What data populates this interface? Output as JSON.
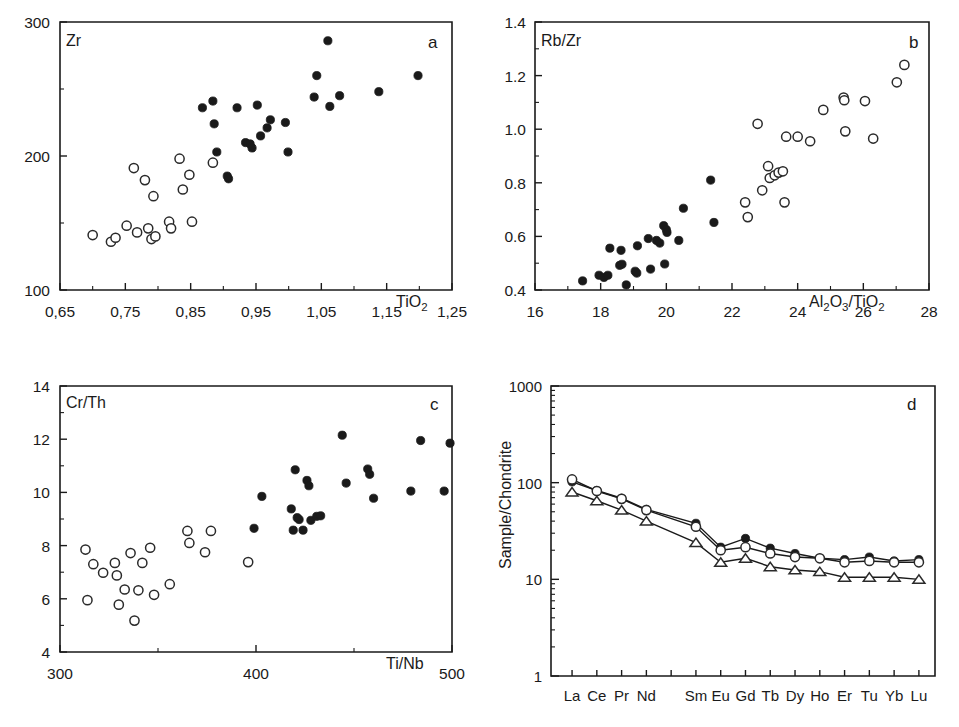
{
  "figure": {
    "panels": [
      "a",
      "b",
      "c",
      "d"
    ]
  },
  "chart_data": [
    {
      "type": "scatter",
      "panel_letter": "a",
      "title": "",
      "ylabel": "Zr",
      "xlabel": "TiO2",
      "xlabel_parts": {
        "base1": "TiO",
        "sub1": "2"
      },
      "xlim": [
        0.65,
        1.25
      ],
      "ylim": [
        100,
        300
      ],
      "xticks": [
        0.65,
        0.75,
        0.85,
        0.95,
        1.05,
        1.15,
        1.25
      ],
      "xticklabels": [
        "0,65",
        "0,75",
        "0,85",
        "0,95",
        "1,05",
        "1,15",
        "1,25"
      ],
      "yticks": [
        100,
        200,
        300
      ],
      "yticklabels": [
        "100",
        "200",
        "300"
      ],
      "yticks_minor": [
        150,
        250
      ],
      "grid": false,
      "legend": "none",
      "series": [
        {
          "name": "open-circle-group",
          "marker": "open-circle",
          "points": [
            [
              0.7,
              141
            ],
            [
              0.728,
              136
            ],
            [
              0.735,
              139
            ],
            [
              0.752,
              148
            ],
            [
              0.763,
              191
            ],
            [
              0.768,
              143
            ],
            [
              0.78,
              182
            ],
            [
              0.785,
              146
            ],
            [
              0.79,
              138
            ],
            [
              0.796,
              140
            ],
            [
              0.793,
              170
            ],
            [
              0.817,
              151
            ],
            [
              0.82,
              146
            ],
            [
              0.833,
              198
            ],
            [
              0.838,
              175
            ],
            [
              0.848,
              186
            ],
            [
              0.852,
              151
            ],
            [
              0.884,
              195
            ]
          ]
        },
        {
          "name": "filled-circle-group",
          "marker": "filled-circle",
          "points": [
            [
              0.868,
              236
            ],
            [
              0.884,
              241
            ],
            [
              0.886,
              224
            ],
            [
              0.89,
              203
            ],
            [
              0.906,
              185
            ],
            [
              0.908,
              183
            ],
            [
              0.921,
              236
            ],
            [
              0.934,
              210
            ],
            [
              0.941,
              209
            ],
            [
              0.944,
              206
            ],
            [
              0.952,
              238
            ],
            [
              0.957,
              215
            ],
            [
              0.967,
              221
            ],
            [
              0.972,
              227
            ],
            [
              0.995,
              225
            ],
            [
              0.999,
              203
            ],
            [
              1.039,
              244
            ],
            [
              1.043,
              260
            ],
            [
              1.06,
              286
            ],
            [
              1.063,
              237
            ],
            [
              1.078,
              245
            ],
            [
              1.138,
              248
            ],
            [
              1.198,
              260
            ]
          ]
        }
      ]
    },
    {
      "type": "scatter",
      "panel_letter": "b",
      "title": "",
      "ylabel": "Rb/Zr",
      "xlabel": "Al2O3/TiO2",
      "xlabel_parts": {
        "base1": "Al",
        "sub1": "2",
        "base2": "O",
        "sub2": "3",
        "base3": "/TiO",
        "sub3": "2"
      },
      "xlim": [
        16,
        28
      ],
      "ylim": [
        0.4,
        1.4
      ],
      "xticks": [
        16,
        18,
        20,
        22,
        24,
        26,
        28
      ],
      "xticklabels": [
        "16",
        "18",
        "20",
        "22",
        "24",
        "26",
        "28"
      ],
      "yticks": [
        0.4,
        0.6,
        0.8,
        1.0,
        1.2,
        1.4
      ],
      "yticklabels": [
        "0.4",
        "0.6",
        "0.8",
        "1.0",
        "1.2",
        "1.4"
      ],
      "grid": false,
      "legend": "none",
      "series": [
        {
          "name": "filled-circle-group",
          "marker": "filled-circle",
          "points": [
            [
              17.45,
              0.434
            ],
            [
              17.95,
              0.455
            ],
            [
              18.1,
              0.447
            ],
            [
              18.22,
              0.455
            ],
            [
              18.28,
              0.556
            ],
            [
              18.58,
              0.492
            ],
            [
              18.62,
              0.548
            ],
            [
              18.65,
              0.496
            ],
            [
              18.78,
              0.419
            ],
            [
              19.05,
              0.47
            ],
            [
              19.1,
              0.463
            ],
            [
              19.12,
              0.565
            ],
            [
              19.45,
              0.592
            ],
            [
              19.52,
              0.478
            ],
            [
              19.7,
              0.585
            ],
            [
              19.8,
              0.575
            ],
            [
              19.92,
              0.64
            ],
            [
              19.95,
              0.497
            ],
            [
              20.0,
              0.625
            ],
            [
              20.02,
              0.615
            ],
            [
              20.38,
              0.585
            ],
            [
              20.52,
              0.705
            ],
            [
              21.35,
              0.81
            ],
            [
              21.45,
              0.652
            ]
          ]
        },
        {
          "name": "open-circle-group",
          "marker": "open-circle",
          "points": [
            [
              22.4,
              0.727
            ],
            [
              22.48,
              0.672
            ],
            [
              22.78,
              1.02
            ],
            [
              22.92,
              0.772
            ],
            [
              23.1,
              0.862
            ],
            [
              23.15,
              0.818
            ],
            [
              23.3,
              0.828
            ],
            [
              23.42,
              0.838
            ],
            [
              23.55,
              0.843
            ],
            [
              23.6,
              0.727
            ],
            [
              23.65,
              0.972
            ],
            [
              24.0,
              0.972
            ],
            [
              24.38,
              0.955
            ],
            [
              24.78,
              1.072
            ],
            [
              25.4,
              1.118
            ],
            [
              25.42,
              1.108
            ],
            [
              25.45,
              0.992
            ],
            [
              26.05,
              1.105
            ],
            [
              26.3,
              0.965
            ],
            [
              27.02,
              1.175
            ],
            [
              27.25,
              1.24
            ]
          ]
        }
      ]
    },
    {
      "type": "scatter",
      "panel_letter": "c",
      "title": "",
      "ylabel": "Cr/Th",
      "xlabel": "Ti/Nb",
      "xlim": [
        300,
        500
      ],
      "ylim": [
        4,
        14
      ],
      "xticks": [
        300,
        400,
        500
      ],
      "xticklabels": [
        "300",
        "400",
        "500"
      ],
      "xticks_minor": [
        350,
        450
      ],
      "yticks": [
        4,
        6,
        8,
        10,
        12,
        14
      ],
      "yticklabels": [
        "4",
        "6",
        "8",
        "10",
        "12",
        "14"
      ],
      "yticks_minor": [
        5,
        7,
        9,
        11,
        13
      ],
      "grid": false,
      "legend": "none",
      "series": [
        {
          "name": "open-circle-group",
          "marker": "open-circle",
          "points": [
            [
              313,
              7.85
            ],
            [
              314,
              5.95
            ],
            [
              317,
              7.3
            ],
            [
              322,
              6.98
            ],
            [
              328,
              7.35
            ],
            [
              329,
              6.88
            ],
            [
              330,
              5.78
            ],
            [
              333,
              6.35
            ],
            [
              336,
              7.72
            ],
            [
              338,
              5.18
            ],
            [
              340,
              6.32
            ],
            [
              342,
              7.35
            ],
            [
              346,
              7.92
            ],
            [
              348,
              6.15
            ],
            [
              356,
              6.55
            ],
            [
              365,
              8.55
            ],
            [
              366,
              8.1
            ],
            [
              374,
              7.75
            ],
            [
              377,
              8.55
            ],
            [
              396,
              7.38
            ]
          ]
        },
        {
          "name": "filled-circle-group",
          "marker": "filled-circle",
          "points": [
            [
              399,
              8.65
            ],
            [
              403,
              9.85
            ],
            [
              418,
              9.38
            ],
            [
              419,
              8.58
            ],
            [
              420,
              10.85
            ],
            [
              421,
              9.05
            ],
            [
              422,
              8.98
            ],
            [
              424,
              8.58
            ],
            [
              426,
              10.45
            ],
            [
              427,
              10.25
            ],
            [
              428,
              8.95
            ],
            [
              431,
              9.1
            ],
            [
              433,
              9.12
            ],
            [
              444,
              12.15
            ],
            [
              446,
              10.35
            ],
            [
              457,
              10.88
            ],
            [
              458,
              10.68
            ],
            [
              460,
              9.78
            ],
            [
              479,
              10.05
            ],
            [
              484,
              11.95
            ],
            [
              496,
              10.05
            ],
            [
              499,
              11.85
            ]
          ]
        }
      ]
    },
    {
      "type": "line",
      "panel_letter": "d",
      "title": "",
      "ylabel": "Sample/Chondrite",
      "xlabel": "",
      "yscale": "log",
      "ylim": [
        1,
        1000
      ],
      "yticks": [
        1,
        10,
        100,
        1000
      ],
      "yticklabels": [
        "1",
        "10",
        "100",
        "1000"
      ],
      "categories": [
        "La",
        "Ce",
        "Pr",
        "Nd",
        "Pm",
        "Sm",
        "Eu",
        "Gd",
        "Tb",
        "Dy",
        "Ho",
        "Er",
        "Tu",
        "Yb",
        "Lu"
      ],
      "categories_shown": [
        "La",
        "Ce",
        "Pr",
        "Nd",
        "Sm",
        "Eu",
        "Gd",
        "Tb",
        "Dy",
        "Ho",
        "Er",
        "Tu",
        "Yb",
        "Lu"
      ],
      "grid": false,
      "legend": "none",
      "series": [
        {
          "name": "filled-circle-series",
          "marker": "filled-circle",
          "x": [
            "La",
            "Ce",
            "Pr",
            "Nd",
            "Sm",
            "Eu",
            "Gd",
            "Tb",
            "Dy",
            "Ho",
            "Er",
            "Tu",
            "Yb",
            "Lu"
          ],
          "values": [
            102,
            83,
            69,
            53,
            38,
            21.5,
            26.5,
            21,
            18.5,
            16.5,
            16,
            17,
            15.5,
            16
          ]
        },
        {
          "name": "open-circle-series",
          "marker": "open-circle",
          "x": [
            "La",
            "Ce",
            "Pr",
            "Nd",
            "Sm",
            "Eu",
            "Gd",
            "Tb",
            "Dy",
            "Ho",
            "Er",
            "Tu",
            "Yb",
            "Lu"
          ],
          "values": [
            108,
            82,
            68,
            52,
            35,
            20,
            21.5,
            18.5,
            17,
            16.5,
            15,
            15.5,
            15,
            15
          ]
        },
        {
          "name": "open-triangle-series",
          "marker": "open-triangle",
          "x": [
            "La",
            "Ce",
            "Pr",
            "Nd",
            "Sm",
            "Eu",
            "Gd",
            "Tb",
            "Dy",
            "Ho",
            "Er",
            "Tu",
            "Yb",
            "Lu"
          ],
          "values": [
            80,
            65,
            52,
            40,
            24,
            15,
            16.5,
            13.5,
            12.5,
            12,
            10.5,
            10.5,
            10.5,
            10
          ]
        }
      ]
    }
  ]
}
